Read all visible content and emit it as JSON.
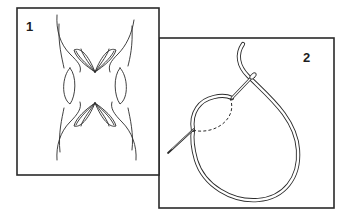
{
  "figure": {
    "panels": [
      {
        "label": "1",
        "description": "Decorative cutwork motif with paired leaf petals and side lens shapes"
      },
      {
        "label": "2",
        "description": "Needle threaded through fabric forming a loop stitch"
      }
    ],
    "colors": {
      "line": "#2b2b2b",
      "background": "#ffffff"
    }
  }
}
